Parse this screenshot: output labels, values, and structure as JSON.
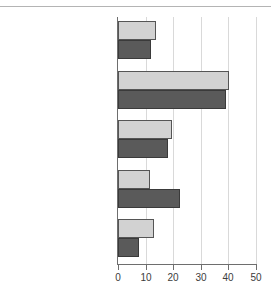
{
  "chart_data": {
    "type": "bar",
    "orientation": "horizontal",
    "title": "",
    "subtitle": "",
    "xlabel": "",
    "ylabel": "",
    "xlim": [
      0,
      50
    ],
    "xticks": [
      0,
      10,
      20,
      30,
      40,
      50
    ],
    "xtick_labels": [
      "0",
      "10",
      "20",
      "30",
      "40",
      "50"
    ],
    "grid": true,
    "legend": false,
    "legend_position": "none",
    "categories": [
      "Providing business\nservices",
      "Providing access\nto finance",
      "Providing/improving\ninfrastructure",
      "Improving skills\nand training",
      "Providing better health\nservice for workers"
    ],
    "series": [
      {
        "name": "series-1",
        "color": "#d2d2d2",
        "values": [
          13.8,
          40.2,
          19.5,
          11.5,
          13.0
        ]
      },
      {
        "name": "series-2",
        "color": "#5a5a5a",
        "values": [
          12.0,
          39.3,
          18.0,
          22.3,
          7.5
        ]
      }
    ]
  },
  "style": {
    "background": "#ffffff",
    "grid_color": "#d9d9d9",
    "axis_color": "#6e6e6e",
    "text_color": "#3c3c3c",
    "light_bar_color": "#d2d2d2",
    "dark_bar_color": "#5a5a5a",
    "bar_edge_color": "#555555",
    "top_rule_color": "#b4b4b4"
  }
}
